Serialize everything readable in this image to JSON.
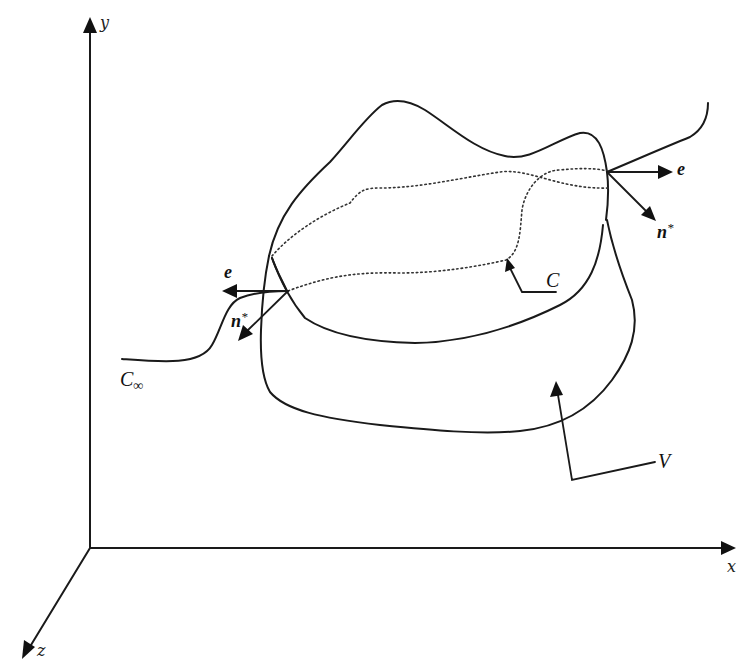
{
  "figure": {
    "type": "3d control volume schematic",
    "axes": {
      "x_label": "x",
      "y_label": "y",
      "z_label": "z"
    },
    "labels": {
      "volume": "V",
      "contour": "C",
      "far_curve_main": "C",
      "far_curve_sub": "∞",
      "unit_vector_right": "e",
      "normal_right": "n",
      "normal_right_sup": "*",
      "unit_vector_left": "e",
      "normal_left": "n",
      "normal_left_sup": "*"
    },
    "colors": {
      "line": "#1a1a1a",
      "background": "#ffffff"
    }
  }
}
